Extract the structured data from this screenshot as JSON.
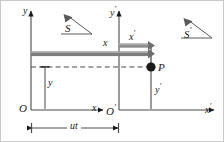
{
  "figure": {
    "type": "physics-diagram",
    "background_color": "#ffffff",
    "line_color": "#1a1a1a",
    "bar_color": "#6e6e6e",
    "bar_highlight_color": "#9a9a9a"
  },
  "frames": {
    "left": {
      "frame_label": "S",
      "origin_label": "O",
      "x_axis_label": "x",
      "y_axis_label": "y",
      "measure_label": "x",
      "vertical_measure_label": "y"
    },
    "right": {
      "frame_label": "S",
      "frame_label_prime": "′",
      "origin_label": "O",
      "origin_label_prime": "′",
      "x_axis_label": "x",
      "x_axis_label_prime": "′",
      "y_axis_label": "y",
      "y_axis_label_prime": "′",
      "measure_label": "x",
      "measure_label_prime": "′",
      "vertical_measure_label": "y",
      "vertical_measure_label_prime": "′"
    }
  },
  "point": {
    "label": "P",
    "marker": "filled-circle"
  },
  "dimension": {
    "label": "ut",
    "description": "separation between origins O and O-prime"
  },
  "icons": {
    "frame_marker": "triangle-arrow-icon",
    "point_marker": "point-p-icon",
    "dimension_arrow": "double-headed-arrow-icon",
    "axis_arrow": "arrowhead-icon",
    "dashed_guide": "dashed-line-icon"
  }
}
